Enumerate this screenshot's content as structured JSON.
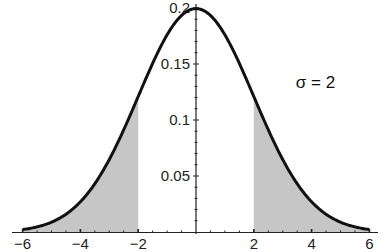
{
  "chart_data": {
    "type": "area",
    "title": "",
    "xlabel": "",
    "ylabel": "",
    "distribution": "normal",
    "mean": 0,
    "sigma": 2,
    "xlim": [
      -6,
      6
    ],
    "ylim": [
      0,
      0.2
    ],
    "x_ticks": [
      -6,
      -4,
      -2,
      2,
      4,
      6
    ],
    "x_tick_labels": [
      "−6",
      "−4",
      "−2",
      "2",
      "4",
      "6"
    ],
    "y_ticks": [
      0.05,
      0.1,
      0.15,
      0.2
    ],
    "y_tick_labels": [
      "0.05",
      "0.1",
      "0.15",
      "0.2"
    ],
    "shaded_regions": [
      [
        -6,
        -2
      ],
      [
        2,
        6
      ]
    ],
    "series": [
      {
        "name": "density",
        "x": [
          -6,
          -5,
          -4,
          -3,
          -2,
          -1,
          0,
          1,
          2,
          3,
          4,
          5,
          6
        ],
        "y": [
          0.0022,
          0.0088,
          0.027,
          0.0648,
          0.121,
          0.176,
          0.1995,
          0.176,
          0.121,
          0.0648,
          0.027,
          0.0088,
          0.0022
        ]
      }
    ],
    "annotations": [
      {
        "text": "σ = 2",
        "x": 3.8,
        "y": 0.12
      }
    ],
    "grid": false,
    "colors": {
      "curve": "#111111",
      "shade": "#c6c6c6",
      "axis": "#222222"
    }
  }
}
